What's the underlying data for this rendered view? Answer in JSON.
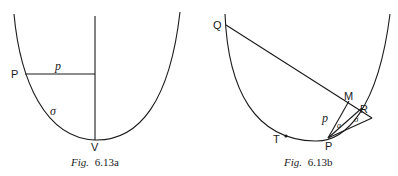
{
  "figures": [
    {
      "id": "fig_a",
      "caption_prefix": "Fig.",
      "caption_number": "6.13a",
      "labels": {
        "P": "P",
        "V": "V",
        "p": "p",
        "sigma": "σ"
      }
    },
    {
      "id": "fig_b",
      "caption_prefix": "Fig.",
      "caption_number": "6.13b",
      "labels": {
        "Q": "Q",
        "M": "M",
        "R": "R",
        "P": "P",
        "T": "T",
        "p": "p",
        "sigma": "σ",
        "small_a": "a"
      }
    }
  ]
}
